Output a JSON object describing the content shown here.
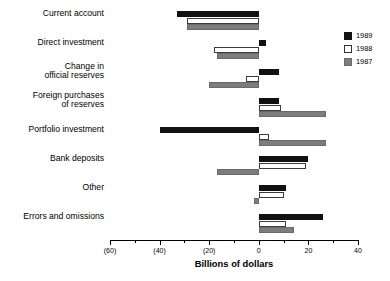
{
  "chart_data": {
    "type": "bar",
    "orientation": "horizontal",
    "title": "",
    "xlabel": "Billions of dollars",
    "ylabel": "",
    "xlim": [
      -60,
      40
    ],
    "xticks": [
      -60,
      -40,
      -20,
      0,
      20,
      40
    ],
    "xtick_labels": [
      "(60)",
      "(40)",
      "(20)",
      "0",
      "20",
      "40"
    ],
    "minor_xticks": [
      -50,
      -30,
      -10,
      10,
      30
    ],
    "grid": false,
    "legend_position": "right-top",
    "categories": [
      "Current account",
      "Direct investment",
      "Change in\nofficial reserves",
      "Foreign purchases\nof reserves",
      "Portfolio investment",
      "Bank deposits",
      "Other",
      "Errors and omissions"
    ],
    "series": [
      {
        "name": "1989",
        "color": "#111111",
        "values": [
          -33,
          3,
          8,
          8,
          -40,
          20,
          11,
          26
        ]
      },
      {
        "name": "1988",
        "color": "#ffffff",
        "values": [
          -29,
          -18,
          -5,
          9,
          4,
          19,
          10,
          11
        ]
      },
      {
        "name": "1987",
        "color": "#7d7d7d",
        "values": [
          -29,
          -17,
          -20,
          27,
          27,
          -17,
          -2,
          14
        ]
      }
    ]
  },
  "legend": {
    "items": [
      {
        "label": "1989",
        "swatch": "s1989"
      },
      {
        "label": "1988",
        "swatch": "s1988"
      },
      {
        "label": "1987",
        "swatch": "s1987"
      }
    ]
  },
  "axis": {
    "title": "Billions of dollars"
  }
}
